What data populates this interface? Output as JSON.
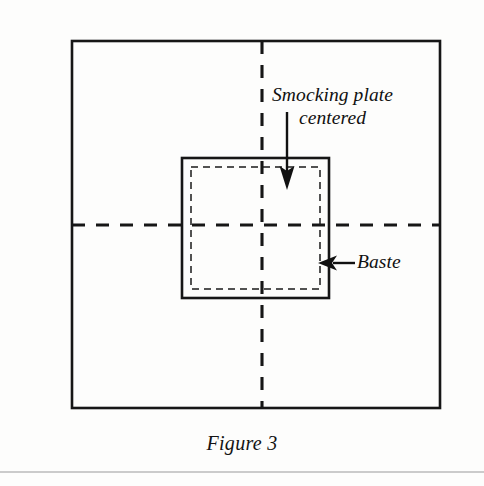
{
  "page": {
    "background_color": "#fdfdfc",
    "ink_color": "#111111"
  },
  "figure": {
    "caption": "Figure 3",
    "outer_square": {
      "name": "fabric-outline",
      "style": "solid",
      "x": 72,
      "y": 41,
      "width": 368,
      "height": 367
    },
    "center_lines": {
      "name": "fabric-center-fold-lines",
      "style": "dashed",
      "vertical_x": 262,
      "horizontal_y": 225
    },
    "inner_square": {
      "name": "smocking-plate-outline",
      "style": "solid",
      "x": 182,
      "y": 158,
      "width": 147,
      "height": 140
    },
    "baste_rectangle": {
      "name": "baste-stitch-line",
      "style": "dashed",
      "x": 191,
      "y": 167,
      "width": 129,
      "height": 122
    }
  },
  "annotations": {
    "smocking_plate": {
      "line1": "Smocking plate",
      "line2": "centered",
      "arrow": {
        "name": "smocking-plate-arrow",
        "direction": "down",
        "from_x": 287,
        "from_y": 112,
        "to_x": 287,
        "to_y": 188
      }
    },
    "baste": {
      "text": "Baste",
      "arrow": {
        "name": "baste-arrow",
        "direction": "left",
        "from_x": 355,
        "from_y": 263,
        "to_x": 319,
        "to_y": 263
      }
    }
  },
  "footer_rule": {
    "name": "page-footer-rule",
    "y": 472
  }
}
